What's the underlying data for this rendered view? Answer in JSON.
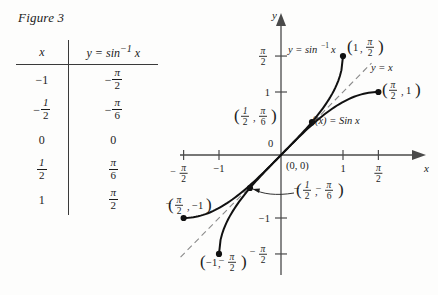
{
  "figure": {
    "caption": "Figure 3"
  },
  "table": {
    "headers": {
      "x": "x",
      "y": "y = sin−1 x"
    },
    "header_y_parts": {
      "lead": "y = sin",
      "exponent": "−1",
      "trail": "x"
    },
    "rows": [
      {
        "x": "−1",
        "x_type": "plain",
        "y_sign": "−",
        "y_num": "π",
        "y_den": "2",
        "y_type": "frac"
      },
      {
        "x": "− 1/2",
        "x_type": "frac",
        "x_sign": "−",
        "x_num": "1",
        "x_den": "2",
        "y_sign": "−",
        "y_num": "π",
        "y_den": "6",
        "y_type": "frac"
      },
      {
        "x": "0",
        "x_type": "plain",
        "y_plain": "0",
        "y_type": "plain"
      },
      {
        "x": "1/2",
        "x_type": "frac",
        "x_sign": "",
        "x_num": "1",
        "x_den": "2",
        "y_sign": "",
        "y_num": "π",
        "y_den": "6",
        "y_type": "frac"
      },
      {
        "x": "1",
        "x_type": "plain",
        "y_sign": "",
        "y_num": "π",
        "y_den": "2",
        "y_type": "frac"
      }
    ]
  },
  "graph": {
    "axis_labels": {
      "x": "x",
      "y": "y"
    },
    "origin_label": "(0, 0)",
    "origin_tick_label": "0",
    "x_ticks": [
      {
        "label_type": "frac",
        "sign": "−",
        "num": "π",
        "den": "2",
        "value": -1.5708
      },
      {
        "label_type": "plain",
        "text": "−1",
        "value": -1
      },
      {
        "label_type": "plain",
        "text": "1",
        "value": 1
      },
      {
        "label_type": "frac",
        "sign": "",
        "num": "π",
        "den": "2",
        "value": 1.5708
      }
    ],
    "y_ticks": [
      {
        "label_type": "frac",
        "sign": "",
        "num": "π",
        "den": "2",
        "value": 1.5708
      },
      {
        "label_type": "plain",
        "text": "1",
        "value": 1
      },
      {
        "label_type": "plain",
        "text": "−1",
        "value": -1
      },
      {
        "label_type": "frac",
        "sign": "−",
        "num": "π",
        "den": "2",
        "value": -1.5708
      }
    ],
    "curves": [
      {
        "name": "arcsine",
        "label_lead": "y = sin",
        "label_exponent": "−1",
        "label_trail": "x",
        "style": "solid"
      },
      {
        "name": "restricted-sine",
        "label": "f(x) = Sin x",
        "style": "solid"
      },
      {
        "name": "identity-line",
        "label": "y = x",
        "style": "dashed"
      }
    ],
    "points": [
      {
        "name": "arcsin-upper-endpoint",
        "x": 1,
        "y": 1.5708,
        "label_x": "1",
        "label_y_num": "π",
        "label_y_den": "2",
        "label_y_sign": ""
      },
      {
        "name": "arcsin-half-point",
        "x": 0.5,
        "y": 0.5236,
        "label_x_frac": true,
        "label_x_num": "1",
        "label_x_den": "2",
        "label_x_sign": "",
        "label_y_num": "π",
        "label_y_den": "6",
        "label_y_sign": ""
      },
      {
        "name": "sine-upper-endpoint",
        "x": 1.5708,
        "y": 1,
        "label_x_frac": true,
        "label_x_num": "π",
        "label_x_den": "2",
        "label_x_sign": "",
        "label_y_plain": "1"
      },
      {
        "name": "sine-lower-endpoint",
        "x": -1.5708,
        "y": -1,
        "label_x_frac": true,
        "label_x_num": "π",
        "label_x_den": "2",
        "label_x_sign": "−",
        "label_y_plain": "−1"
      },
      {
        "name": "arcsin-lower-endpoint",
        "x": -1,
        "y": -1.5708,
        "label_x": "−1",
        "label_y_num": "π",
        "label_y_den": "2",
        "label_y_sign": "−"
      },
      {
        "name": "arcsin-neg-half-point",
        "x": -0.5,
        "y": -0.5236,
        "label_x_frac": true,
        "label_x_num": "1",
        "label_x_den": "2",
        "label_x_sign": "−",
        "label_y_num": "π",
        "label_y_den": "6",
        "label_y_sign": "−"
      }
    ],
    "colors": {
      "axis": "#4a4a4a",
      "curve": "#111111",
      "dashed": "#8a8a8a",
      "text": "#1b1b1b"
    }
  }
}
